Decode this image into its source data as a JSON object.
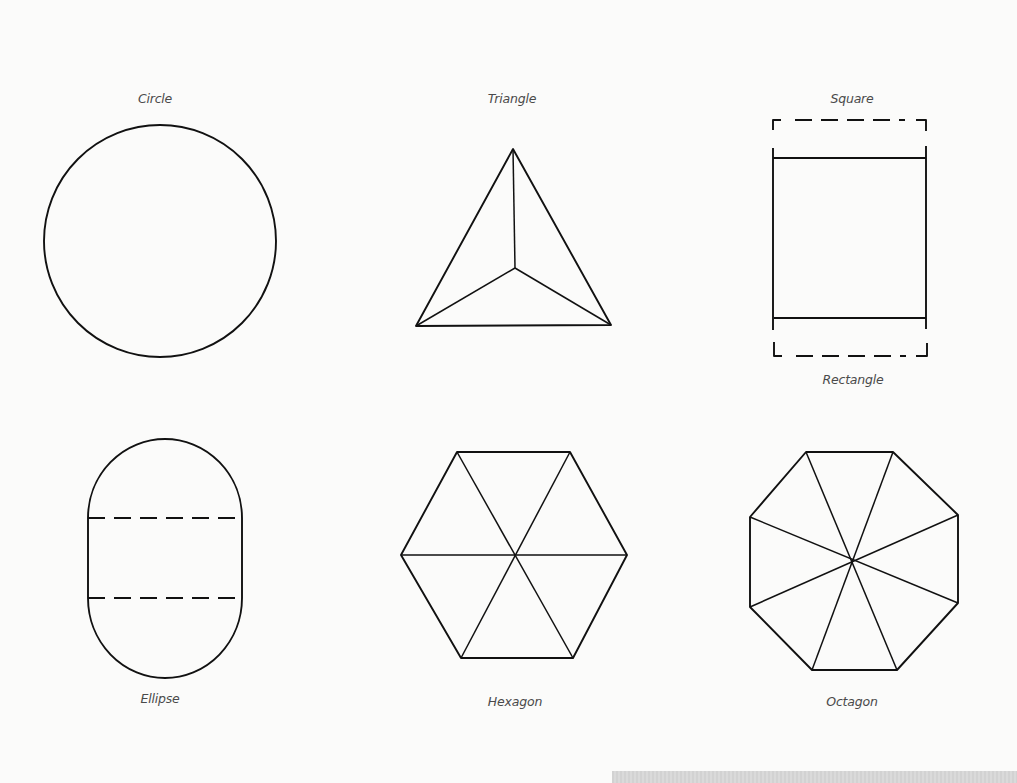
{
  "diagram": {
    "shapes": [
      {
        "id": "circle",
        "label": "Circle"
      },
      {
        "id": "triangle",
        "label": "Triangle"
      },
      {
        "id": "square",
        "label": "Square"
      },
      {
        "id": "rectangle",
        "label": "Rectangle"
      },
      {
        "id": "ellipse",
        "label": "Ellipse"
      },
      {
        "id": "hexagon",
        "label": "Hexagon"
      },
      {
        "id": "octagon",
        "label": "Octagon"
      }
    ]
  },
  "colors": {
    "background": "#fbfbfa",
    "stroke": "#111111",
    "label": "#4a4a4a",
    "bottom_band": "#d6d6d6"
  }
}
